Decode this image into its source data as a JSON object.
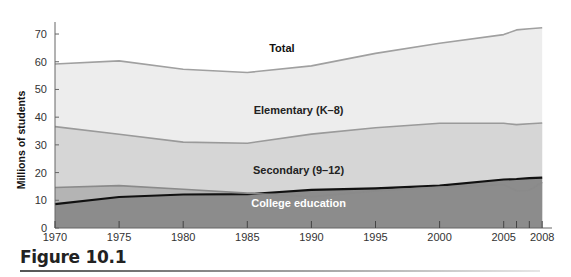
{
  "chart_data": {
    "type": "area",
    "stacked": true,
    "title": "",
    "xlabel": "",
    "ylabel": "Millions of students",
    "ylim": [
      0,
      75
    ],
    "yticks": [
      0,
      10,
      20,
      30,
      40,
      50,
      60,
      70
    ],
    "xticks": [
      1970,
      1975,
      1980,
      1985,
      1990,
      1995,
      2000,
      2005,
      2006,
      2007,
      2008
    ],
    "xtick_labels": [
      "1970",
      "1975",
      "1980",
      "1985",
      "1990",
      "1995",
      "2000",
      "2005",
      "",
      "",
      "2008"
    ],
    "grid": false,
    "legend": "inline labels",
    "x": [
      1970,
      1975,
      1980,
      1985,
      1990,
      1995,
      2000,
      2005,
      2006,
      2007,
      2008
    ],
    "series": [
      {
        "name": "College education",
        "boundary": "cumulative top",
        "values": [
          8.6,
          11.2,
          12.1,
          12.2,
          13.8,
          14.3,
          15.3,
          17.5,
          17.7,
          18.0,
          18.2
        ]
      },
      {
        "name": "Secondary (9–12)",
        "boundary": "cumulative top",
        "values": [
          14.6,
          15.3,
          14.0,
          12.6,
          11.3,
          13.4,
          14.8,
          15.6,
          13.5,
          13.6,
          16.5
        ]
      },
      {
        "name": "Elementary (K–8)",
        "boundary": "cumulative top",
        "values": [
          36.6,
          33.8,
          31.0,
          30.6,
          33.9,
          36.2,
          37.8,
          37.8,
          37.3,
          37.6,
          37.9
        ]
      },
      {
        "name": "Total",
        "boundary": "cumulative top",
        "values": [
          59.2,
          60.3,
          57.3,
          56.1,
          58.5,
          63.0,
          66.7,
          69.8,
          71.5,
          71.9,
          72.3
        ]
      }
    ],
    "band_fills": {
      "College education": "#8c8c8c",
      "Secondary (9–12)": "#b4b4b4",
      "Elementary (K–8)": "#d6d6d6",
      "Total": "#ededed"
    },
    "line_colors": {
      "College education": "#111111",
      "Secondary (9–12)": "#8a8a8a",
      "Elementary (K–8)": "#9a9a9a",
      "Total": "#a0a0a0"
    },
    "label_colors": {
      "College education": "#ffffff",
      "Secondary (9–12)": "#222222",
      "Elementary (K–8)": "#222222",
      "Total": "#111111"
    },
    "label_positions": {
      "Total": [
        1987.7,
        63.5
      ],
      "Elementary (K–8)": [
        1989,
        41
      ],
      "Secondary (9–12)": [
        1989,
        19.5
      ],
      "College education": [
        1989,
        7.7
      ]
    },
    "caption": "Figure 10.1"
  }
}
